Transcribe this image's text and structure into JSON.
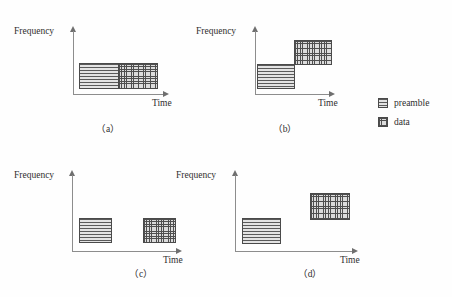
{
  "figure": {
    "axis_labels": {
      "y": "Frequency",
      "x": "Time"
    },
    "colors": {
      "axis": "#8d8d8d",
      "block_border": "#4a4a4a",
      "preamble_fill": "#e3e3e3",
      "data_fill": "#dcdcdc",
      "text": "#2e2e2e",
      "background": "#fefefe"
    }
  },
  "panels": [
    {
      "id": "a",
      "caption": "（a）",
      "y_label": "Frequency",
      "x_label": "Time",
      "blocks": [
        {
          "kind": "preamble",
          "label": "preamble"
        },
        {
          "kind": "data",
          "label": "data"
        }
      ],
      "arrangement": "contiguous-same-frequency"
    },
    {
      "id": "b",
      "caption": "（b）",
      "y_label": "Frequency",
      "x_label": "Time",
      "blocks": [
        {
          "kind": "preamble",
          "label": "preamble"
        },
        {
          "kind": "data",
          "label": "data"
        }
      ],
      "arrangement": "corner-touching-frequency-step"
    },
    {
      "id": "c",
      "caption": "（c）",
      "y_label": "Frequency",
      "x_label": "Time",
      "blocks": [
        {
          "kind": "preamble",
          "label": "preamble"
        },
        {
          "kind": "data",
          "label": "data"
        }
      ],
      "arrangement": "time-gap-same-frequency"
    },
    {
      "id": "d",
      "caption": "（d）",
      "y_label": "Frequency",
      "x_label": "Time",
      "blocks": [
        {
          "kind": "preamble",
          "label": "preamble"
        },
        {
          "kind": "data",
          "label": "data"
        }
      ],
      "arrangement": "time-gap-frequency-step"
    }
  ],
  "legend": {
    "items": [
      {
        "key": "preamble",
        "label": "preamble",
        "pattern": "horizontal-lines"
      },
      {
        "key": "data",
        "label": "data",
        "pattern": "cross-hatch-grid"
      }
    ]
  }
}
